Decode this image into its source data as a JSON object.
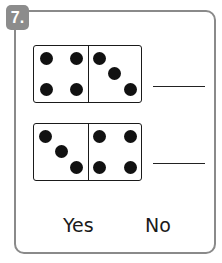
{
  "question": {
    "number": "7.",
    "badge_color": "#8c8c8c",
    "border_color": "#8a8a8a"
  },
  "dominoes": [
    {
      "left_pips": 4,
      "right_pips": 3,
      "answer": ""
    },
    {
      "left_pips": 3,
      "right_pips": 4,
      "answer": ""
    }
  ],
  "choices": {
    "yes": "Yes",
    "no": "No"
  }
}
